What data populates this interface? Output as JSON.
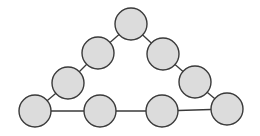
{
  "diagram": {
    "type": "graph",
    "colors": {
      "background": "#ffffff",
      "node_fill": "#dcdcdc",
      "node_stroke": "#3a3a3a",
      "edge": "#3a3a3a"
    },
    "node_radius": 16,
    "nodes": [
      {
        "id": "n1",
        "x": 131,
        "y": 24
      },
      {
        "id": "n2",
        "x": 98,
        "y": 53
      },
      {
        "id": "n3",
        "x": 68,
        "y": 83
      },
      {
        "id": "n4",
        "x": 35,
        "y": 111
      },
      {
        "id": "n5",
        "x": 100,
        "y": 111
      },
      {
        "id": "n6",
        "x": 162,
        "y": 111
      },
      {
        "id": "n7",
        "x": 227,
        "y": 109
      },
      {
        "id": "n8",
        "x": 195,
        "y": 82
      },
      {
        "id": "n9",
        "x": 163,
        "y": 54
      }
    ],
    "edges": [
      [
        "n1",
        "n2"
      ],
      [
        "n2",
        "n3"
      ],
      [
        "n3",
        "n4"
      ],
      [
        "n4",
        "n5"
      ],
      [
        "n5",
        "n6"
      ],
      [
        "n6",
        "n7"
      ],
      [
        "n7",
        "n8"
      ],
      [
        "n8",
        "n9"
      ],
      [
        "n9",
        "n1"
      ]
    ]
  }
}
